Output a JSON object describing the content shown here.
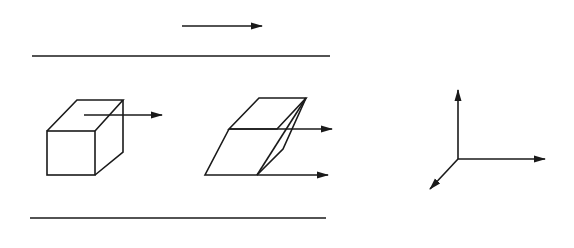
{
  "figure": {
    "type": "fluid shear element diagram",
    "colors": {
      "ink": "#1a1a1a",
      "background": "#ffffff"
    },
    "free_stream": {
      "label": "U"
    },
    "top_wall": {
      "description": "upper plate (hatched)"
    },
    "bottom_wall": {
      "description": "lower plate (hatched)"
    },
    "cube_element": {
      "force_label": "dF",
      "dim_x": "dx",
      "dim_y": "dy",
      "dim_z": "dz"
    },
    "sheared_element": {
      "top_velocity_label": "u+du",
      "bottom_velocity_label": "u"
    },
    "axes": {
      "x": "x",
      "y": "y",
      "z": "z"
    }
  }
}
